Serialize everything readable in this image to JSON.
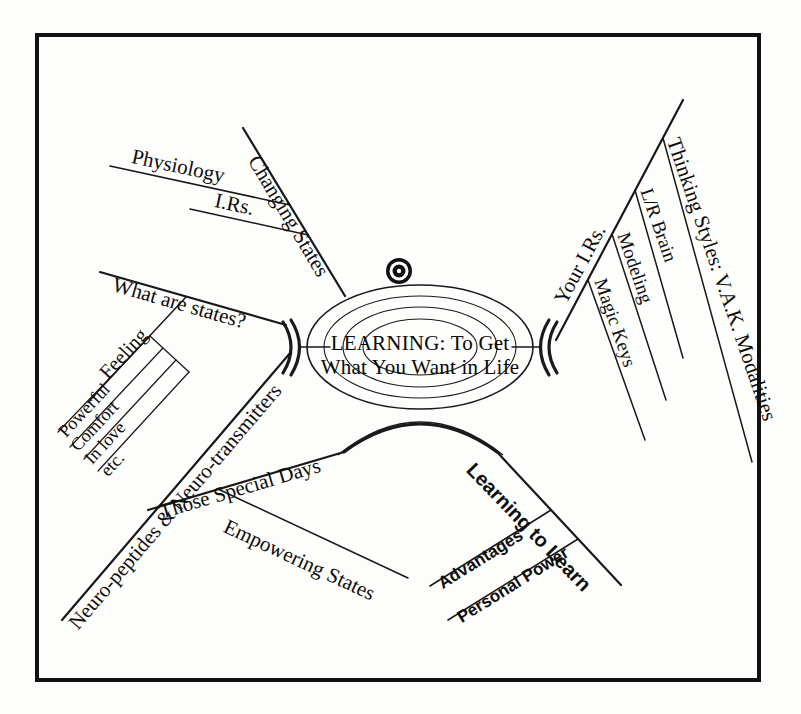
{
  "diagram": {
    "type": "mind-map",
    "title": "LEARNING: To Get What You Want in Life",
    "background_color": "#fdfdfc",
    "ink_color": "#111111",
    "frame": {
      "present": true,
      "style": "rectangular border"
    },
    "center": {
      "line1": "LEARNING: To Get",
      "line2": "What You Want in Life",
      "rings": 4,
      "icon": "eye-icon"
    },
    "branches": [
      {
        "id": "changing-states",
        "label": "Changing States",
        "position": "upper-left",
        "children": [
          {
            "id": "physiology",
            "label": "Physiology"
          },
          {
            "id": "irs",
            "label": "I.Rs."
          }
        ]
      },
      {
        "id": "what-are-states",
        "label": "What are states?",
        "position": "left",
        "children": [
          {
            "id": "feeling",
            "label": "Feeling",
            "children": [
              {
                "id": "powerful",
                "label": "Powerful"
              },
              {
                "id": "comfort",
                "label": "Comfort"
              },
              {
                "id": "in-love",
                "label": "In love"
              },
              {
                "id": "etc",
                "label": "etc."
              }
            ]
          }
        ]
      },
      {
        "id": "neuro-peptides",
        "label": "Neuro-peptides & Neuro-transmitters",
        "position": "lower-left",
        "children": []
      },
      {
        "id": "those-special-days",
        "label": "Those Special Days",
        "position": "bottom-left",
        "children": [
          {
            "id": "empowering-states",
            "label": "Empowering States"
          }
        ]
      },
      {
        "id": "learning-to-learn",
        "label": "Learning to Learn",
        "position": "bottom-right",
        "font": "sans-serif",
        "children": [
          {
            "id": "advantages",
            "label": "Advantages"
          },
          {
            "id": "personal-power",
            "label": "Personal Power"
          }
        ]
      },
      {
        "id": "your-irs",
        "label": "Your I.Rs.",
        "position": "right",
        "children": [
          {
            "id": "magic-keys",
            "label": "Magic Keys"
          },
          {
            "id": "modeling",
            "label": "Modeling"
          },
          {
            "id": "lr-brain",
            "label": "L/R Brain"
          },
          {
            "id": "thinking-styles",
            "label": "Thinking Styles: V.A.K. Modalities"
          }
        ]
      }
    ]
  }
}
